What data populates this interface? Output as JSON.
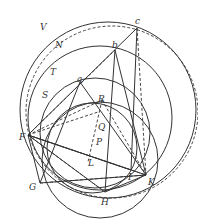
{
  "diagram": {
    "type": "geometric-construction",
    "circle_labels": [
      "V",
      "N",
      "T",
      "S"
    ],
    "point_labels": {
      "a": "a",
      "b": "b",
      "c": "c",
      "F": "F",
      "G": "G",
      "H": "H",
      "I": "I",
      "K": "K",
      "L": "L",
      "P": "P",
      "Q": "Q",
      "R": "R"
    }
  }
}
